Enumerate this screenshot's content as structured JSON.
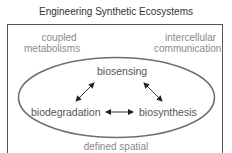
{
  "title": "Engineering Synthetic Ecosystems",
  "corner_labels": {
    "top_left": [
      "coupled",
      "metabolisms"
    ],
    "top_right": [
      "intercellular",
      "communication"
    ],
    "bottom": "defined spatial"
  },
  "core_nodes": {
    "top": "biosensing",
    "left": "biodegradation",
    "right": "biosynthesis"
  },
  "edges": [
    {
      "from": "biosensing",
      "to": "biodegradation",
      "type": "bidirectional"
    },
    {
      "from": "biosensing",
      "to": "biosynthesis",
      "type": "bidirectional"
    },
    {
      "from": "biodegradation",
      "to": "biosynthesis",
      "type": "bidirectional"
    }
  ],
  "colors": {
    "frame": "#555555",
    "ellipse": "#6e6e6e",
    "outer_text": "#8a8a8a",
    "core_text": "#555555",
    "arrows": "#222222"
  }
}
